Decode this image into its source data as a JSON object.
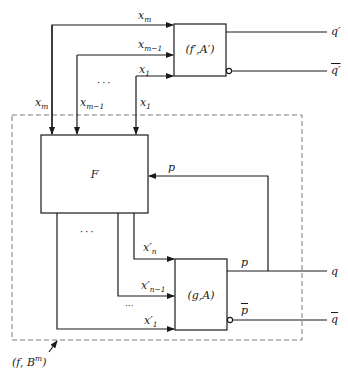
{
  "diagram": {
    "title": "",
    "blocks": {
      "top_block": {
        "label": "(f′,A′)"
      },
      "f_block": {
        "label": "F"
      },
      "g_block": {
        "label": "(g,A)"
      }
    },
    "enclosure": {
      "label": "(f, B",
      "label_sup": "m",
      "label_end": ")"
    },
    "top_inputs": [
      {
        "base": "x",
        "sub": "m"
      },
      {
        "base": "x",
        "sub": "m−1"
      },
      {
        "base": "x",
        "sub": "1"
      }
    ],
    "f_inputs": [
      {
        "base": "x",
        "sub": "m"
      },
      {
        "base": "x",
        "sub": "m−1"
      },
      {
        "base": "x",
        "sub": "1"
      }
    ],
    "g_inputs": [
      {
        "base": "x′",
        "sub": "n"
      },
      {
        "base": "x′",
        "sub": "n−1"
      },
      {
        "base": "x′",
        "sub": "1"
      }
    ],
    "outputs": {
      "q_prime": "q′",
      "q_prime_bar": "q′",
      "q": "q",
      "q_bar": "q",
      "p": "p",
      "p_bar": "p",
      "feedback_p": "p"
    },
    "ellipsis_h": "···",
    "ellipsis_v": "···"
  }
}
